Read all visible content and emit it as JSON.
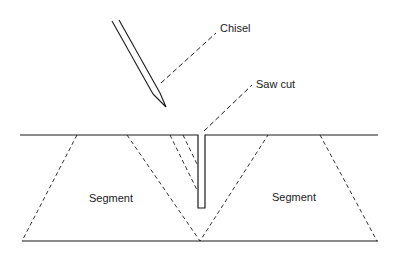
{
  "diagram": {
    "labels": {
      "chisel": "Chisel",
      "saw_cut": "Saw cut",
      "segment_left": "Segment",
      "segment_right": "Segment"
    },
    "colors": {
      "stroke": "#1a1a1a",
      "background": "#ffffff"
    }
  }
}
